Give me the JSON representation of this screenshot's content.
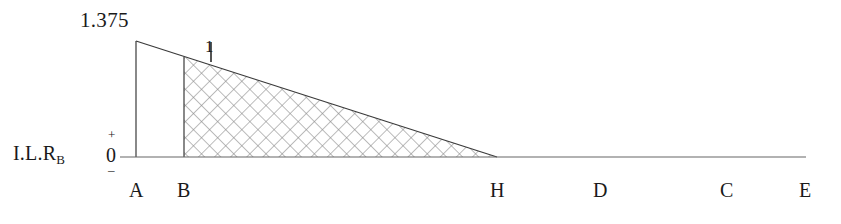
{
  "figure": {
    "name": "influence-line-reaction-RB",
    "axis_label": "I.L.R",
    "axis_label_subscript": "B",
    "sign_positive": "+",
    "sign_zero": "0",
    "sign_negative": "–",
    "peak_label": "1.375",
    "ordinate_label": "1"
  },
  "colors": {
    "ink": "#1a1a1a",
    "hatch": "#8a8a8a",
    "baseline": "#555555",
    "outline": "#3a3a3a",
    "background": "#ffffff"
  },
  "stations": [
    {
      "label": "A",
      "x": 136
    },
    {
      "label": "B",
      "x": 184
    },
    {
      "label": "H",
      "x": 497
    },
    {
      "label": "D",
      "x": 600
    },
    {
      "label": "C",
      "x": 727
    },
    {
      "label": "E",
      "x": 806
    }
  ],
  "chart_data": {
    "type": "line",
    "xlabel": "",
    "ylabel": "I.L.R_B",
    "grid": false,
    "legend": null,
    "baseline_value": 0,
    "x_categories": [
      "A",
      "B",
      "H",
      "D",
      "C",
      "E"
    ],
    "annotations": [
      {
        "text": "1.375",
        "at": "A",
        "value": 1.375
      },
      {
        "text": "1",
        "at": "B",
        "value": 1.0
      },
      {
        "text": "+",
        "at": "axis-above-zero"
      },
      {
        "text": "0",
        "at": "axis-zero"
      },
      {
        "text": "–",
        "at": "axis-below-zero"
      }
    ],
    "series": [
      {
        "name": "I.L.R_B",
        "values": [
          1.375,
          1.0,
          0,
          0,
          0,
          0
        ],
        "x": [
          "A",
          "B",
          "H",
          "D",
          "C",
          "E"
        ]
      }
    ],
    "shaded_region": {
      "from": "B",
      "to": "H",
      "fill": "cross-hatch",
      "sign": "positive"
    },
    "unshaded_region": {
      "from": "A",
      "to": "B"
    },
    "ylim": [
      0,
      1.375
    ]
  }
}
